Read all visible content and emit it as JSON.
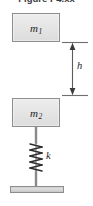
{
  "figure": {
    "caption": "Figure P4.xx",
    "type": "mechanics-free-body-diagram"
  },
  "blocks": [
    {
      "id": "m1",
      "label": "m",
      "subscript": "1",
      "role": "upper-mass",
      "x": 12,
      "y": 13,
      "width": 48,
      "height": 29
    },
    {
      "id": "m2",
      "label": "m",
      "subscript": "2",
      "role": "lower-mass",
      "x": 12,
      "y": 98,
      "width": 48,
      "height": 29
    }
  ],
  "dimension": {
    "name": "h",
    "label": "h",
    "meaning": "drop-height-between-masses",
    "arrow_style": "double-headed",
    "from_y": 42,
    "to_y": 95,
    "line_x": 72
  },
  "spring": {
    "label": "k",
    "meaning": "spring-stiffness",
    "coils": 7,
    "top_y": 143,
    "bottom_y": 172,
    "center_x": 36
  },
  "rod": {
    "name": "connecting-rod",
    "center_x": 36,
    "top_y": 127,
    "bottom_y": 188
  },
  "ground": {
    "name": "fixed-support",
    "x": 10,
    "y": 186,
    "width": 54,
    "height": 7
  },
  "colors": {
    "block_fill": "#e4e4e4",
    "block_border": "#8d8d8d",
    "line": "#6e6e6e",
    "ink": "#1e1e1e",
    "ground_fill": "#d2d2d2",
    "background": "#ffffff"
  }
}
